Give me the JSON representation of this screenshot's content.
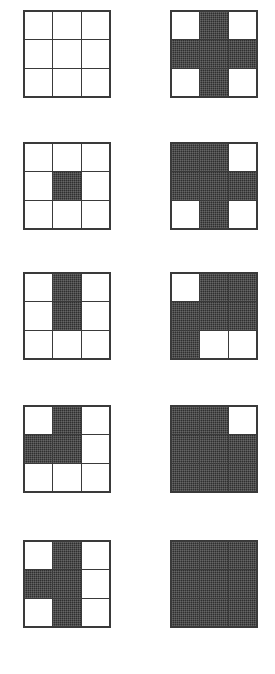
{
  "figure": {
    "grid_size": 3,
    "cell_states": [
      "empty",
      "filled"
    ],
    "colors": {
      "fill": "#2f2f2f",
      "empty": "#ffffff",
      "border": "#3a3a3a",
      "background": "#ffffff"
    },
    "rows": [
      {
        "index": 1,
        "left": {
          "name": "grid-1-left",
          "cells": [
            0,
            0,
            0,
            0,
            0,
            0,
            0,
            0,
            0
          ]
        },
        "right": {
          "name": "grid-1-right",
          "cells": [
            0,
            1,
            0,
            1,
            1,
            1,
            0,
            1,
            0
          ]
        }
      },
      {
        "index": 2,
        "left": {
          "name": "grid-2-left",
          "cells": [
            0,
            0,
            0,
            0,
            1,
            0,
            0,
            0,
            0
          ]
        },
        "right": {
          "name": "grid-2-right",
          "cells": [
            1,
            1,
            0,
            1,
            1,
            1,
            0,
            1,
            0
          ]
        }
      },
      {
        "index": 3,
        "left": {
          "name": "grid-3-left",
          "cells": [
            0,
            1,
            0,
            0,
            1,
            0,
            0,
            0,
            0
          ]
        },
        "right": {
          "name": "grid-3-right",
          "cells": [
            0,
            1,
            1,
            1,
            1,
            1,
            1,
            0,
            0
          ]
        }
      },
      {
        "index": 4,
        "left": {
          "name": "grid-4-left",
          "cells": [
            0,
            1,
            0,
            1,
            1,
            0,
            0,
            0,
            0
          ]
        },
        "right": {
          "name": "grid-4-right",
          "cells": [
            1,
            1,
            0,
            1,
            1,
            1,
            1,
            1,
            1
          ]
        }
      },
      {
        "index": 5,
        "left": {
          "name": "grid-5-left",
          "cells": [
            0,
            1,
            0,
            1,
            1,
            0,
            0,
            1,
            0
          ]
        },
        "right": {
          "name": "grid-5-right",
          "cells": [
            1,
            1,
            1,
            1,
            1,
            1,
            1,
            1,
            1
          ]
        }
      }
    ],
    "row_tops": [
      10,
      142,
      272,
      405,
      540
    ]
  }
}
